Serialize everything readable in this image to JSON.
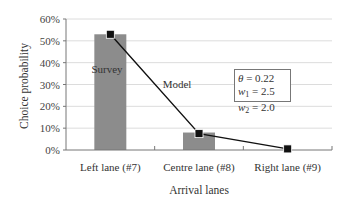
{
  "chart_data": {
    "type": "bar",
    "title": "",
    "xlabel": "Arrival lanes",
    "ylabel": "Choice probability",
    "ylim": [
      0,
      0.6
    ],
    "yticks": [
      "0%",
      "10%",
      "20%",
      "30%",
      "40%",
      "50%",
      "60%"
    ],
    "grid": true,
    "categories": [
      "Left lane (#7)",
      "Centre lane (#8)",
      "Right lane (#9)"
    ],
    "series": [
      {
        "name": "Survey",
        "type": "bar",
        "color": "#8c8c8c",
        "values": [
          0.53,
          0.08,
          0.0
        ]
      },
      {
        "name": "Model",
        "type": "line",
        "marker": "square",
        "color": "#111111",
        "values": [
          0.53,
          0.075,
          0.005
        ]
      }
    ],
    "annotations": {
      "survey_label": "Survey",
      "model_label": "Model"
    },
    "parameters_box": {
      "theta": "θ = 0.22",
      "w1": "w1 = 2.5",
      "w2": "w2 = 2.0"
    }
  },
  "legend": {
    "theta_sym": "θ",
    "theta_val": " = 0.22",
    "w1_sym": "w",
    "w1_sub": "1",
    "w1_val": " = 2.5",
    "w2_sym": "w",
    "w2_sub": "2",
    "w2_val": " = 2.0"
  }
}
